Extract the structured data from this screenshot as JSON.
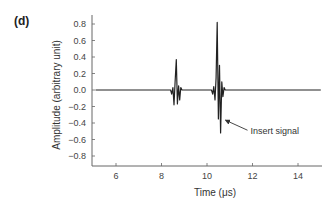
{
  "panel_label": "(d)",
  "chart_data": {
    "type": "line",
    "title": "",
    "xlabel": "Time (μs)",
    "ylabel": "Amplitude (arbitrary unit)",
    "xlim": [
      5.1,
      15.0
    ],
    "ylim": [
      -0.92,
      0.9
    ],
    "x_ticks": [
      6,
      8,
      10,
      12,
      14
    ],
    "x_tick_labels": [
      "6",
      "8",
      "10",
      "12",
      "14"
    ],
    "y_ticks": [
      0.8,
      0.6,
      0.4,
      0.2,
      0.0,
      -0.2,
      -0.4,
      -0.6,
      -0.8
    ],
    "y_tick_labels": [
      "0.8",
      "0.6",
      "0.4",
      "0.2",
      "0.0",
      "−0.2",
      "−0.4",
      "−0.6",
      "−0.8"
    ],
    "grid": false,
    "legend": null,
    "series": [
      {
        "name": "Ultrasonic A-scan signal",
        "color": "#222222",
        "x": [
          5.1,
          8.4,
          8.45,
          8.5,
          8.55,
          8.6,
          8.65,
          8.7,
          8.75,
          8.8,
          8.85,
          8.9,
          10.2,
          10.25,
          10.3,
          10.35,
          10.4,
          10.45,
          10.5,
          10.55,
          10.6,
          10.65,
          10.7,
          10.75,
          10.8,
          15.0
        ],
        "y": [
          0.0,
          0.0,
          -0.05,
          0.03,
          -0.18,
          0.1,
          0.37,
          -0.17,
          0.05,
          -0.12,
          0.03,
          0.0,
          0.0,
          -0.05,
          0.04,
          -0.12,
          0.15,
          0.82,
          -0.35,
          0.3,
          -0.52,
          0.1,
          -0.08,
          0.03,
          0.0,
          0.0
        ]
      }
    ],
    "annotations": [
      {
        "text": "Insert signal",
        "points_to": {
          "x": 10.55,
          "y": -0.33
        }
      }
    ],
    "pulses": [
      {
        "center_us": 8.65,
        "max": 0.37,
        "min": -0.18
      },
      {
        "center_us": 10.45,
        "max": 0.82,
        "min": -0.52
      }
    ]
  }
}
